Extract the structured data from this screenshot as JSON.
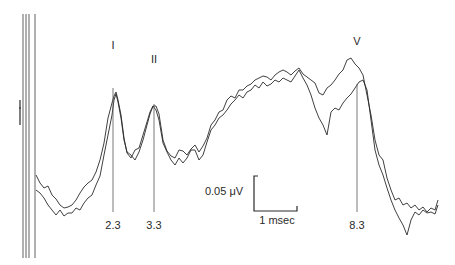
{
  "chart_data": {
    "type": "line",
    "title": "",
    "xlabel": "",
    "ylabel": "",
    "grid": false,
    "legend": null,
    "peaks": [
      {
        "label": "I",
        "latency": "2.3",
        "latency_value": 2.3,
        "x_px": 113,
        "top_px": 88
      },
      {
        "label": "II",
        "latency": "3.3",
        "latency_value": 3.3,
        "x_px": 154,
        "top_px": 104
      },
      {
        "label": "V",
        "latency": "8.3",
        "latency_value": 8.3,
        "x_px": 357,
        "top_px": 84
      }
    ],
    "scale_bar": {
      "amplitude_label": "0.05 μV",
      "amplitude_value": 0.05,
      "amplitude_unit": "μV",
      "time_label": "1 msec",
      "time_value": 1,
      "time_unit": "msec"
    },
    "series": [
      {
        "name": "trace-upper",
        "points": [
          [
            36,
            175
          ],
          [
            40,
            183
          ],
          [
            44,
            188
          ],
          [
            48,
            186
          ],
          [
            52,
            195
          ],
          [
            56,
            199
          ],
          [
            60,
            205
          ],
          [
            64,
            208
          ],
          [
            68,
            207
          ],
          [
            72,
            205
          ],
          [
            76,
            200
          ],
          [
            80,
            193
          ],
          [
            84,
            187
          ],
          [
            88,
            183
          ],
          [
            92,
            180
          ],
          [
            96,
            172
          ],
          [
            100,
            160
          ],
          [
            104,
            143
          ],
          [
            108,
            118
          ],
          [
            112,
            103
          ],
          [
            114,
            96
          ],
          [
            116,
            92
          ],
          [
            118,
            100
          ],
          [
            121,
            115
          ],
          [
            124,
            138
          ],
          [
            127,
            153
          ],
          [
            131,
            158
          ],
          [
            135,
            150
          ],
          [
            139,
            148
          ],
          [
            143,
            135
          ],
          [
            147,
            122
          ],
          [
            150,
            112
          ],
          [
            153,
            106
          ],
          [
            156,
            106
          ],
          [
            159,
            114
          ],
          [
            163,
            140
          ],
          [
            167,
            151
          ],
          [
            171,
            156
          ],
          [
            175,
            158
          ],
          [
            179,
            150
          ],
          [
            183,
            151
          ],
          [
            187,
            155
          ],
          [
            191,
            149
          ],
          [
            195,
            145
          ],
          [
            199,
            152
          ],
          [
            203,
            146
          ],
          [
            207,
            138
          ],
          [
            211,
            125
          ],
          [
            215,
            120
          ],
          [
            219,
            112
          ],
          [
            223,
            110
          ],
          [
            227,
            100
          ],
          [
            231,
            96
          ],
          [
            235,
            98
          ],
          [
            239,
            90
          ],
          [
            243,
            90
          ],
          [
            247,
            86
          ],
          [
            251,
            84
          ],
          [
            255,
            80
          ],
          [
            259,
            78
          ],
          [
            263,
            76
          ],
          [
            267,
            77
          ],
          [
            271,
            80
          ],
          [
            275,
            75
          ],
          [
            279,
            72
          ],
          [
            283,
            70
          ],
          [
            287,
            72
          ],
          [
            291,
            75
          ],
          [
            295,
            71
          ],
          [
            299,
            68
          ],
          [
            303,
            74
          ],
          [
            307,
            77
          ],
          [
            311,
            80
          ],
          [
            315,
            83
          ],
          [
            319,
            93
          ],
          [
            323,
            95
          ],
          [
            327,
            88
          ],
          [
            331,
            85
          ],
          [
            335,
            80
          ],
          [
            339,
            74
          ],
          [
            343,
            70
          ],
          [
            347,
            60
          ],
          [
            351,
            58
          ],
          [
            355,
            64
          ],
          [
            359,
            68
          ],
          [
            363,
            75
          ],
          [
            367,
            95
          ],
          [
            371,
            115
          ],
          [
            375,
            140
          ],
          [
            379,
            155
          ],
          [
            383,
            160
          ],
          [
            387,
            178
          ],
          [
            391,
            190
          ],
          [
            395,
            200
          ],
          [
            399,
            198
          ],
          [
            403,
            205
          ],
          [
            407,
            203
          ],
          [
            411,
            208
          ],
          [
            415,
            205
          ],
          [
            419,
            210
          ],
          [
            423,
            207
          ],
          [
            427,
            212
          ],
          [
            431,
            208
          ],
          [
            435,
            210
          ],
          [
            438,
            200
          ]
        ]
      },
      {
        "name": "trace-lower",
        "points": [
          [
            36,
            190
          ],
          [
            40,
            193
          ],
          [
            44,
            198
          ],
          [
            48,
            205
          ],
          [
            52,
            210
          ],
          [
            56,
            215
          ],
          [
            60,
            210
          ],
          [
            64,
            216
          ],
          [
            68,
            213
          ],
          [
            72,
            213
          ],
          [
            76,
            208
          ],
          [
            80,
            210
          ],
          [
            84,
            203
          ],
          [
            88,
            198
          ],
          [
            92,
            195
          ],
          [
            96,
            185
          ],
          [
            100,
            176
          ],
          [
            104,
            155
          ],
          [
            108,
            135
          ],
          [
            112,
            115
          ],
          [
            114,
            100
          ],
          [
            116,
            94
          ],
          [
            118,
            102
          ],
          [
            121,
            118
          ],
          [
            124,
            140
          ],
          [
            127,
            152
          ],
          [
            131,
            155
          ],
          [
            135,
            160
          ],
          [
            139,
            152
          ],
          [
            143,
            140
          ],
          [
            147,
            125
          ],
          [
            150,
            114
          ],
          [
            153,
            106
          ],
          [
            156,
            110
          ],
          [
            159,
            120
          ],
          [
            163,
            143
          ],
          [
            167,
            152
          ],
          [
            171,
            160
          ],
          [
            175,
            165
          ],
          [
            179,
            158
          ],
          [
            183,
            163
          ],
          [
            187,
            158
          ],
          [
            191,
            150
          ],
          [
            195,
            150
          ],
          [
            199,
            160
          ],
          [
            203,
            155
          ],
          [
            207,
            142
          ],
          [
            211,
            130
          ],
          [
            215,
            125
          ],
          [
            219,
            118
          ],
          [
            223,
            115
          ],
          [
            227,
            110
          ],
          [
            231,
            104
          ],
          [
            235,
            100
          ],
          [
            239,
            95
          ],
          [
            243,
            98
          ],
          [
            247,
            92
          ],
          [
            251,
            90
          ],
          [
            255,
            85
          ],
          [
            259,
            88
          ],
          [
            263,
            82
          ],
          [
            267,
            86
          ],
          [
            271,
            84
          ],
          [
            275,
            80
          ],
          [
            279,
            82
          ],
          [
            283,
            78
          ],
          [
            287,
            80
          ],
          [
            291,
            82
          ],
          [
            295,
            76
          ],
          [
            299,
            70
          ],
          [
            303,
            78
          ],
          [
            307,
            85
          ],
          [
            311,
            95
          ],
          [
            315,
            108
          ],
          [
            319,
            118
          ],
          [
            323,
            125
          ],
          [
            327,
            135
          ],
          [
            331,
            112
          ],
          [
            335,
            108
          ],
          [
            339,
            110
          ],
          [
            343,
            103
          ],
          [
            347,
            98
          ],
          [
            351,
            94
          ],
          [
            355,
            88
          ],
          [
            359,
            82
          ],
          [
            363,
            80
          ],
          [
            367,
            90
          ],
          [
            371,
            120
          ],
          [
            375,
            150
          ],
          [
            379,
            165
          ],
          [
            383,
            175
          ],
          [
            387,
            188
          ],
          [
            391,
            200
          ],
          [
            395,
            210
          ],
          [
            399,
            218
          ],
          [
            403,
            225
          ],
          [
            407,
            235
          ],
          [
            411,
            220
          ],
          [
            415,
            212
          ],
          [
            419,
            215
          ],
          [
            423,
            210
          ],
          [
            427,
            213
          ],
          [
            431,
            212
          ],
          [
            435,
            214
          ],
          [
            438,
            205
          ]
        ]
      }
    ]
  }
}
